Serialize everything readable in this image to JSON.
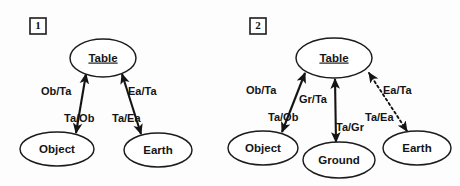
{
  "figure": {
    "background_color": "#fdfdfd",
    "ink_color": "#141414",
    "panels": [
      {
        "number": "1",
        "nodes": [
          {
            "id": "table1",
            "label": "Table",
            "underlined": true,
            "cx": 103,
            "cy": 58,
            "rx": 33,
            "ry": 19
          },
          {
            "id": "object1",
            "label": "Object",
            "underlined": false,
            "cx": 57,
            "cy": 149,
            "rx": 37,
            "ry": 17
          },
          {
            "id": "earth1",
            "label": "Earth",
            "underlined": false,
            "cx": 158,
            "cy": 150,
            "rx": 34,
            "ry": 17
          }
        ],
        "edges": [
          {
            "id": "object-table-1",
            "from": "object1",
            "to": "table1",
            "style": "solid",
            "arrows": "both",
            "label_out": "Ob/Ta",
            "label_in": "Ta/Ob"
          },
          {
            "id": "earth-table-1",
            "from": "earth1",
            "to": "table1",
            "style": "solid",
            "arrows": "both",
            "label_out": "Ea/Ta",
            "label_in": "Ta/Ea"
          }
        ]
      },
      {
        "number": "2",
        "nodes": [
          {
            "id": "table2",
            "label": "Table",
            "underlined": true,
            "cx": 334,
            "cy": 58,
            "rx": 38,
            "ry": 20
          },
          {
            "id": "object2",
            "label": "Object",
            "underlined": false,
            "cx": 263,
            "cy": 148,
            "rx": 35,
            "ry": 17
          },
          {
            "id": "ground2",
            "label": "Ground",
            "underlined": false,
            "cx": 339,
            "cy": 160,
            "rx": 36,
            "ry": 18
          },
          {
            "id": "earth2",
            "label": "Earth",
            "underlined": false,
            "cx": 417,
            "cy": 148,
            "rx": 34,
            "ry": 17
          }
        ],
        "edges": [
          {
            "id": "object-table-2",
            "from": "object2",
            "to": "table2",
            "style": "solid",
            "arrows": "both",
            "label_out": "Ob/Ta",
            "label_in": "Ta/Ob"
          },
          {
            "id": "ground-table-2",
            "from": "ground2",
            "to": "table2",
            "style": "solid",
            "arrows": "both",
            "label_out": "Gr/Ta",
            "label_in": "Ta/Gr"
          },
          {
            "id": "earth-table-2",
            "from": "earth2",
            "to": "table2",
            "style": "dotted",
            "arrows": "both",
            "label_out": "Ea/Ta",
            "label_in": "Ta/Ea"
          }
        ]
      }
    ]
  },
  "labels": {
    "panel1": {
      "number": "1",
      "node_table": "Table",
      "node_object": "Object",
      "node_earth": "Earth",
      "edge_ob_ta": "Ob/Ta",
      "edge_ta_ob": "Ta/Ob",
      "edge_ea_ta": "Ea/Ta",
      "edge_ta_ea": "Ta/Ea"
    },
    "panel2": {
      "number": "2",
      "node_table": "Table",
      "node_object": "Object",
      "node_ground": "Ground",
      "node_earth": "Earth",
      "edge_ob_ta": "Ob/Ta",
      "edge_ta_ob": "Ta/Ob",
      "edge_gr_ta": "Gr/Ta",
      "edge_ta_gr": "Ta/Gr",
      "edge_ea_ta": "Ea/Ta",
      "edge_ta_ea": "Ta/Ea"
    }
  }
}
